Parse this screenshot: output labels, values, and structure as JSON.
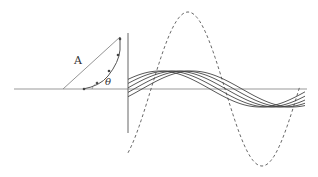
{
  "figure": {
    "type": "phasor-wave-diagram",
    "labels": {
      "amplitude": "A",
      "angle": "θ"
    },
    "colors": {
      "line": "#555555",
      "axis": "#888888",
      "dashed": "#666666"
    },
    "axes": {
      "horizontal": {
        "x1": 14,
        "x2": 307,
        "y": 89
      },
      "vertical": {
        "x": 128,
        "y1": 33,
        "y2": 133
      }
    },
    "phasor": {
      "origin": [
        63,
        89
      ],
      "tip": [
        120,
        37
      ],
      "arc_start": [
        83,
        89
      ]
    },
    "dashed_sine": {
      "x_start": 128,
      "x_end": 300,
      "center_y": 89,
      "amplitude": 77,
      "period": 148,
      "peak_x": 188
    },
    "solid_waves": {
      "count": 5,
      "x_start": 128,
      "x_end": 305,
      "amplitude": 18,
      "center_y": 89,
      "period": 200,
      "phase_offsets_px": [
        0,
        8,
        16,
        24,
        32
      ]
    }
  }
}
